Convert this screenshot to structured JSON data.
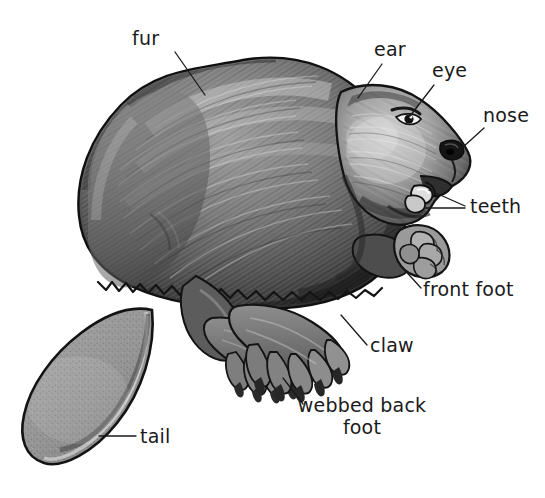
{
  "image": {
    "kind": "labeled-anatomy-illustration",
    "subject": "beaver",
    "background_color": "#ffffff",
    "ink_color": "#1a1a1a",
    "width": 545,
    "height": 498
  },
  "palette": {
    "background": "#ffffff",
    "outline": "#141414",
    "fur_dark": "#3a3a3a",
    "fur_mid": "#6e6e6e",
    "fur_light": "#b4b4b4",
    "fur_highlight": "#d8d8d8",
    "tail_fill": "#9a9a9a",
    "tail_shadow": "#7c7c7c",
    "foot_fill": "#8a8a8a",
    "eye_dark": "#1b1b1b",
    "eye_highlight": "#ffffff",
    "tooth_light": "#e8e8e8"
  },
  "labels": [
    {
      "id": "fur",
      "name": "fur",
      "lines": [
        "fur"
      ],
      "text_x": 132,
      "text_y": 45,
      "anchor": "start",
      "leader": [
        [
          175,
          52
        ],
        [
          205,
          95
        ]
      ]
    },
    {
      "id": "ear",
      "name": "ear",
      "lines": [
        "ear"
      ],
      "text_x": 374,
      "text_y": 56,
      "anchor": "start",
      "leader": [
        [
          382,
          64
        ],
        [
          358,
          98
        ]
      ]
    },
    {
      "id": "eye",
      "name": "eye",
      "lines": [
        "eye"
      ],
      "text_x": 432,
      "text_y": 77,
      "anchor": "start",
      "leader": [
        [
          434,
          85
        ],
        [
          410,
          116
        ]
      ]
    },
    {
      "id": "nose",
      "name": "nose",
      "lines": [
        "nose"
      ],
      "text_x": 483,
      "text_y": 122,
      "anchor": "start",
      "leader": [
        [
          484,
          128
        ],
        [
          462,
          148
        ]
      ]
    },
    {
      "id": "teeth",
      "name": "teeth",
      "lines": [
        "teeth"
      ],
      "text_x": 470,
      "text_y": 213,
      "anchor": "start",
      "leader_multi": [
        [
          [
            465,
            206
          ],
          [
            429,
            190
          ]
        ],
        [
          [
            465,
            208
          ],
          [
            425,
            206
          ]
        ]
      ]
    },
    {
      "id": "front-foot",
      "name": "front foot",
      "lines": [
        "front foot"
      ],
      "text_x": 423,
      "text_y": 296,
      "anchor": "start",
      "leader": [
        [
          421,
          288
        ],
        [
          401,
          266
        ]
      ]
    },
    {
      "id": "claw",
      "name": "claw",
      "lines": [
        "claw"
      ],
      "text_x": 370,
      "text_y": 352,
      "anchor": "start",
      "leader": [
        [
          367,
          345
        ],
        [
          341,
          315
        ]
      ]
    },
    {
      "id": "webbed-back-foot",
      "name": "webbed back foot",
      "lines": [
        "webbed back",
        "foot"
      ],
      "text_x": 362,
      "text_y": 412,
      "anchor": "middle",
      "line_height": 22,
      "leader": [
        [
          303,
          404
        ],
        [
          283,
          378
        ]
      ]
    },
    {
      "id": "tail",
      "name": "tail",
      "lines": [
        "tail"
      ],
      "text_x": 140,
      "text_y": 443,
      "anchor": "start",
      "leader": [
        [
          136,
          436
        ],
        [
          99,
          436
        ]
      ]
    }
  ]
}
